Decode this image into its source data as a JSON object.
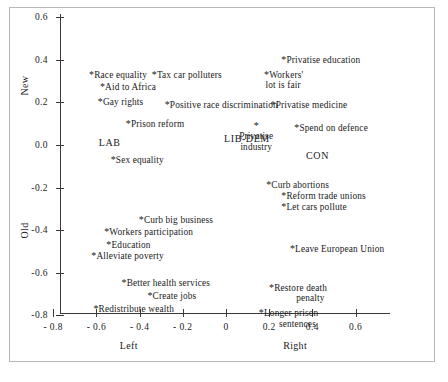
{
  "chart_data": {
    "type": "scatter",
    "title": "",
    "xlabel_left": "Left",
    "xlabel_right": "Right",
    "ylabel_top": "New",
    "ylabel_bottom": "Old",
    "xlim": [
      -0.85,
      0.72
    ],
    "ylim": [
      -0.88,
      0.66
    ],
    "xticks": [
      -0.8,
      -0.6,
      -0.4,
      -0.2,
      0,
      0.2,
      0.4,
      0.6
    ],
    "xticklabels": [
      "- 0.8",
      "- 0.6",
      "- 0.4",
      "- 0.2",
      "0",
      "0.2",
      "0.4",
      "0.6"
    ],
    "yticks": [
      0.6,
      0.4,
      0.2,
      0.0,
      -0.2,
      -0.4,
      -0.6,
      -0.8
    ],
    "yticklabels": [
      "0.6",
      "0.4",
      "0.2",
      "0.0",
      "-0.2",
      "-0.4",
      "-0.6",
      "-0.8"
    ],
    "grid": false,
    "legend": "none",
    "marker": "*",
    "points": [
      {
        "label": "Race equality",
        "x": -0.62,
        "y": 0.33,
        "align": "left"
      },
      {
        "label": "Tax car polluters",
        "x": -0.33,
        "y": 0.33,
        "align": "left"
      },
      {
        "label": "Aid to Africa",
        "x": -0.57,
        "y": 0.27,
        "align": "left"
      },
      {
        "label": "Gay rights",
        "x": -0.58,
        "y": 0.2,
        "align": "left"
      },
      {
        "label": "Positive race discrimination",
        "x": -0.27,
        "y": 0.19,
        "align": "left"
      },
      {
        "label": "Privatise education",
        "x": 0.27,
        "y": 0.4,
        "align": "left"
      },
      {
        "label": "Workers'\nlot is fair",
        "x": 0.33,
        "y": 0.33,
        "align": "right"
      },
      {
        "label": "Privatise medicine",
        "x": 0.22,
        "y": 0.19,
        "align": "left"
      },
      {
        "label": "Prison reform",
        "x": -0.45,
        "y": 0.1,
        "align": "left"
      },
      {
        "label": "Privatise\nindustry",
        "x": 0.14,
        "y": 0.09,
        "align": "center"
      },
      {
        "label": "Spend on defence",
        "x": 0.33,
        "y": 0.08,
        "align": "left"
      },
      {
        "label": "Sex equality",
        "x": -0.52,
        "y": -0.07,
        "align": "left"
      },
      {
        "label": "Curb abortions",
        "x": 0.2,
        "y": -0.19,
        "align": "left"
      },
      {
        "label": "Reform trade unions",
        "x": 0.27,
        "y": -0.24,
        "align": "left"
      },
      {
        "label": "Let cars pollute",
        "x": 0.27,
        "y": -0.29,
        "align": "left"
      },
      {
        "label": "Curb big business",
        "x": -0.39,
        "y": -0.35,
        "align": "left"
      },
      {
        "label": "Workers participation",
        "x": -0.55,
        "y": -0.41,
        "align": "left"
      },
      {
        "label": "Education",
        "x": -0.54,
        "y": -0.47,
        "align": "left"
      },
      {
        "label": "Alleviate poverty",
        "x": -0.61,
        "y": -0.52,
        "align": "left"
      },
      {
        "label": "Leave European Union",
        "x": 0.31,
        "y": -0.49,
        "align": "left"
      },
      {
        "label": "Better health services",
        "x": -0.47,
        "y": -0.65,
        "align": "left"
      },
      {
        "label": "Create jobs",
        "x": -0.35,
        "y": -0.71,
        "align": "left"
      },
      {
        "label": "Redistribute wealth",
        "x": -0.6,
        "y": -0.77,
        "align": "left"
      },
      {
        "label": "Restore death\npenalty",
        "x": 0.44,
        "y": -0.67,
        "align": "right"
      },
      {
        "label": "Longer prison\nsentences",
        "x": 0.4,
        "y": -0.79,
        "align": "right"
      }
    ],
    "parties": [
      {
        "label": "LAB",
        "x": -0.58,
        "y": 0.01
      },
      {
        "label": "LIB-DEM",
        "x": 0.0,
        "y": 0.03
      },
      {
        "label": "CON",
        "x": 0.38,
        "y": -0.05
      }
    ]
  }
}
